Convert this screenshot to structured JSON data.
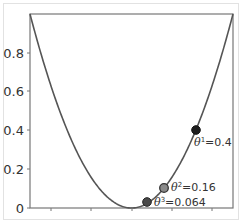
{
  "chart_data": {
    "type": "line",
    "title": "",
    "xlabel": "",
    "ylabel": "",
    "xlim": [
      -1,
      1
    ],
    "ylim": [
      0,
      1
    ],
    "grid": false,
    "legend": null,
    "series": [
      {
        "name": "curve",
        "function": "y = x^2",
        "color": "#555555"
      }
    ],
    "x_ticks": [
      -0.8,
      -0.4,
      0,
      0.4,
      0.8
    ],
    "x_tick_labels": [],
    "y_ticks": [
      0,
      0.2,
      0.4,
      0.6,
      0.8
    ],
    "y_tick_labels": [
      "0",
      "0.2",
      "0.4",
      "0.6",
      "0.8"
    ],
    "points": [
      {
        "label": "θ¹=0.4",
        "sup": "1",
        "value": "0.4",
        "x": 0.635,
        "y": 0.4,
        "fill": "#1e1e1e"
      },
      {
        "label": "θ²=0.16",
        "sup": "2",
        "value": "0.16",
        "x": 0.32,
        "y": 0.103,
        "fill": "#8a8a8a"
      },
      {
        "label": "θ³=0.064",
        "sup": "3",
        "value": "0.064",
        "x": 0.153,
        "y": 0.031,
        "fill": "#4a4a4a"
      }
    ]
  },
  "annotations": {
    "p1": {
      "theta": "θ",
      "sup": "1",
      "rest": "=0.4"
    },
    "p2": {
      "theta": "θ",
      "sup": "2",
      "rest": "=0.16"
    },
    "p3": {
      "theta": "θ",
      "sup": "3",
      "rest": "=0.064"
    }
  },
  "y_tick_labels": {
    "t0": "0",
    "t1": "0.2",
    "t2": "0.4",
    "t3": "0.6",
    "t4": "0.8"
  }
}
